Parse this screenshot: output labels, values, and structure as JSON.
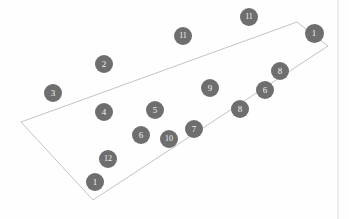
{
  "figure": {
    "type": "scatter-in-polygon",
    "background_color": "#fefefe",
    "width": 349,
    "height": 219,
    "marker_fill": "#6e6e6e",
    "marker_text_color": "#f2f2f2",
    "polygon_stroke": "#b4b4b4",
    "polygon_fill": "none",
    "border_stroke": "#d0d0d0"
  },
  "polygon": {
    "name": "region-outline",
    "points": "21,122 297,22 328,46 93,200",
    "stroke_width": 0.8
  },
  "right_border": {
    "name": "right-edge-rule",
    "x": 338,
    "y1": 0,
    "y2": 219,
    "stroke_width": 0.8
  },
  "markers": [
    {
      "label": "1",
      "x": 314,
      "y": 33,
      "r": 9.5,
      "font_size": 9
    },
    {
      "label": "11",
      "x": 249,
      "y": 17,
      "r": 9.0,
      "font_size": 8
    },
    {
      "label": "11",
      "x": 183,
      "y": 36,
      "r": 9.0,
      "font_size": 8
    },
    {
      "label": "2",
      "x": 104,
      "y": 64,
      "r": 9.0,
      "font_size": 9
    },
    {
      "label": "8",
      "x": 280,
      "y": 71,
      "r": 9.0,
      "font_size": 9
    },
    {
      "label": "3",
      "x": 53,
      "y": 93,
      "r": 9.0,
      "font_size": 9
    },
    {
      "label": "9",
      "x": 210,
      "y": 88,
      "r": 9.0,
      "font_size": 9
    },
    {
      "label": "6",
      "x": 265,
      "y": 90,
      "r": 9.0,
      "font_size": 9
    },
    {
      "label": "4",
      "x": 104,
      "y": 112,
      "r": 9.0,
      "font_size": 9
    },
    {
      "label": "5",
      "x": 155,
      "y": 110,
      "r": 9.0,
      "font_size": 9
    },
    {
      "label": "8",
      "x": 240,
      "y": 109,
      "r": 9.0,
      "font_size": 9
    },
    {
      "label": "6",
      "x": 141,
      "y": 135,
      "r": 9.0,
      "font_size": 9
    },
    {
      "label": "10",
      "x": 169,
      "y": 139,
      "r": 9.0,
      "font_size": 8
    },
    {
      "label": "7",
      "x": 194,
      "y": 129,
      "r": 9.0,
      "font_size": 9
    },
    {
      "label": "12",
      "x": 108,
      "y": 159,
      "r": 9.0,
      "font_size": 8
    },
    {
      "label": "1",
      "x": 95,
      "y": 182,
      "r": 9.0,
      "font_size": 9
    }
  ],
  "chart_data": {
    "type": "scatter",
    "title": "",
    "xlabel": "",
    "ylabel": "",
    "grid": false,
    "legend": "none",
    "annotations": [
      "Quadrilateral region outlined in light gray",
      "Sixteen numbered circular markers, labels 1-12 with repeats"
    ],
    "point_labels": [
      "1",
      "11",
      "11",
      "2",
      "8",
      "3",
      "9",
      "6",
      "4",
      "5",
      "8",
      "6",
      "10",
      "7",
      "12",
      "1"
    ],
    "x": [
      314,
      249,
      183,
      104,
      280,
      53,
      210,
      265,
      104,
      155,
      240,
      141,
      169,
      194,
      108,
      95
    ],
    "y": [
      33,
      17,
      36,
      64,
      71,
      93,
      88,
      90,
      112,
      110,
      109,
      135,
      139,
      129,
      159,
      182
    ],
    "xlim": [
      0,
      349
    ],
    "ylim": [
      219,
      0
    ],
    "polygon_vertices": [
      [
        21,
        122
      ],
      [
        297,
        22
      ],
      [
        328,
        46
      ],
      [
        93,
        200
      ]
    ]
  }
}
